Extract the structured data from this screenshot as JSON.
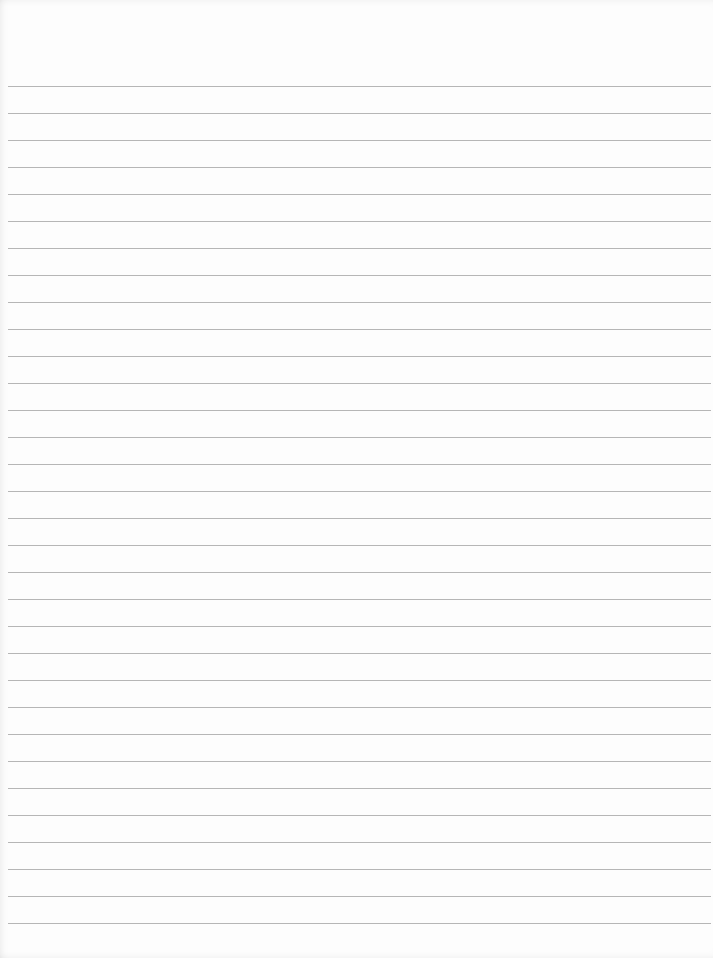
{
  "sheet": {
    "type": "lined-paper",
    "background_color": "#fdfdfd",
    "rule_color": "#a9a9a9",
    "rule_count": 32,
    "first_rule_y": 86,
    "rule_spacing": 27,
    "rule_left": 8,
    "text": ""
  }
}
